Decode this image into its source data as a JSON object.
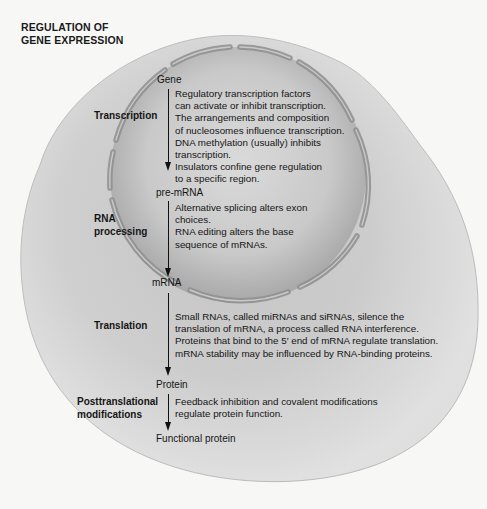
{
  "title": {
    "line1": "REGULATION OF",
    "line2": "GENE EXPRESSION"
  },
  "molecules": {
    "gene": "Gene",
    "pre_mrna": "pre-mRNA",
    "mrna": "mRNA",
    "protein": "Protein",
    "functional_protein": "Functional protein"
  },
  "stages": {
    "transcription": {
      "label": "Transcription",
      "description": [
        "Regulatory transcription factors",
        "can activate or inhibit transcription.",
        "The arrangements and composition",
        "of nucleosomes influence transcription.",
        "DNA methylation (usually) inhibits",
        "transcription.",
        "Insulators confine gene regulation",
        "to a specific region."
      ]
    },
    "rna_processing": {
      "label_line1": "RNA",
      "label_line2": "processing",
      "description": [
        "Alternative splicing alters exon",
        "choices.",
        "RNA editing alters the base",
        "sequence of mRNAs."
      ]
    },
    "translation": {
      "label": "Translation",
      "description": [
        "Small RNAs, called miRNAs and siRNAs, silence the",
        "translation of mRNA, a process called RNA interference.",
        "Proteins that bind to the 5′ end of mRNA regulate translation.",
        "mRNA stability may be influenced by RNA-binding proteins."
      ]
    },
    "posttranslational": {
      "label_line1": "Posttranslational",
      "label_line2": "modifications",
      "description": [
        "Feedback inhibition and covalent modifications",
        "regulate protein function."
      ]
    }
  },
  "colors": {
    "page_background": "#f7f7f6",
    "cell_fill": "#d2d2d2",
    "nucleus_fill": "#bdbdbd",
    "nuclear_envelope": "#9a9a9a",
    "text": "#151515"
  }
}
